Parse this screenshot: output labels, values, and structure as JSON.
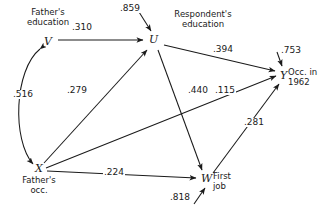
{
  "diagram": {
    "type": "path-diagram",
    "background_color": "#ffffff",
    "stroke_color": "#1a1a1a",
    "nodes": [
      {
        "id": "V",
        "letter": "V",
        "caption": "Father's\neducation",
        "x": 47,
        "y": 43,
        "caption_x": 47,
        "caption_y": 12
      },
      {
        "id": "X",
        "letter": "X",
        "caption": "Father's\nocc.",
        "x": 38,
        "y": 170,
        "caption_x": 38,
        "caption_y": 176
      },
      {
        "id": "U",
        "letter": "U",
        "caption": "Respondent's\neducation",
        "x": 153,
        "y": 41,
        "caption_x": 203,
        "caption_y": 14
      },
      {
        "id": "W",
        "letter": "W",
        "caption": "First\njob",
        "x": 205,
        "y": 181,
        "caption_x": 233,
        "caption_y": 171
      },
      {
        "id": "Y",
        "letter": "Y",
        "caption": "Occ. in\n1962",
        "x": 283,
        "y": 76,
        "caption_x": 307,
        "caption_y": 66
      }
    ],
    "paths": [
      {
        "id": "V-U",
        "from": "V",
        "to": "U",
        "coefficient": ".310",
        "label_x": 80,
        "label_y": 28,
        "kind": "directed"
      },
      {
        "id": "X-U",
        "from": "X",
        "to": "U",
        "coefficient": ".279",
        "label_x": 76,
        "label_y": 91,
        "kind": "directed"
      },
      {
        "id": "U-Y",
        "from": "U",
        "to": "Y",
        "coefficient": ".394",
        "label_x": 222,
        "label_y": 50,
        "kind": "directed"
      },
      {
        "id": "U-W",
        "from": "U",
        "to": "W",
        "coefficient": ".440",
        "label_x": 196,
        "label_y": 91,
        "kind": "directed"
      },
      {
        "id": "X-Y",
        "from": "X",
        "to": "Y",
        "coefficient": ".115",
        "label_x": 222,
        "label_y": 91,
        "kind": "directed"
      },
      {
        "id": "W-Y",
        "from": "W",
        "to": "Y",
        "coefficient": ".281",
        "label_x": 250,
        "label_y": 123,
        "kind": "directed"
      },
      {
        "id": "X-W",
        "from": "X",
        "to": "W",
        "coefficient": ".224",
        "label_x": 110,
        "label_y": 173,
        "kind": "directed"
      },
      {
        "id": "V-X",
        "from": "V",
        "to": "X",
        "coefficient": ".516",
        "label_x": 16,
        "label_y": 95,
        "kind": "correlation-curved-double"
      }
    ],
    "residuals": [
      {
        "id": "res-U",
        "to": "U",
        "coefficient": ".859",
        "label_x": 127,
        "label_y": 9
      },
      {
        "id": "res-Y",
        "to": "Y",
        "coefficient": ".753",
        "label_x": 284,
        "label_y": 52
      },
      {
        "id": "res-W",
        "to": "W",
        "coefficient": ".818",
        "label_x": 176,
        "label_y": 196
      }
    ]
  }
}
